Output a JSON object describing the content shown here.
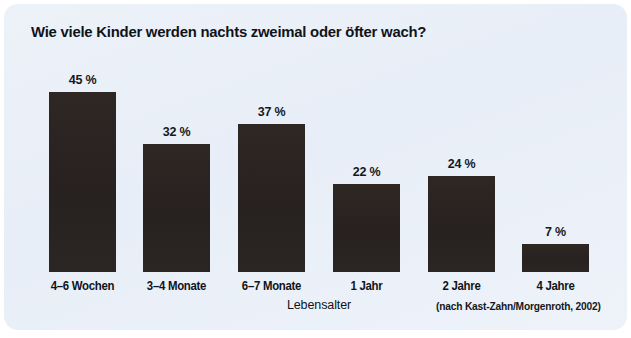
{
  "figure": {
    "title": "Wie viele Kinder werden nachts zweimal oder öfter wach?",
    "source_note": "(nach Kast-Zahn/Morgenroth, 2002)",
    "panel_color": "#eaf0f8",
    "bar_color": "#2a2422",
    "text_color": "#10141a"
  },
  "chart_data": {
    "type": "bar",
    "title": "Wie viele Kinder werden nachts zweimal oder öfter wach?",
    "xlabel": "Lebensalter",
    "ylabel": "",
    "categories": [
      "4–6 Wochen",
      "3–4 Monate",
      "6–7 Monate",
      "1 Jahr",
      "2 Jahre",
      "4 Jahre"
    ],
    "values": [
      45,
      32,
      37,
      22,
      24,
      7
    ],
    "value_labels": [
      "45 %",
      "32 %",
      "37 %",
      "22 %",
      "24 %",
      "7 %"
    ],
    "unit": "%",
    "ylim": [
      0,
      45
    ],
    "grid": false,
    "legend": null,
    "annotations": [
      "(nach Kast-Zahn/Morgenroth, 2002)"
    ],
    "bars": [
      {
        "category": "4–6 Wochen",
        "value": 45,
        "label": "45 %",
        "left": 45,
        "top": 88,
        "width": 67,
        "height": 180
      },
      {
        "category": "3–4 Monate",
        "value": 32,
        "label": "32 %",
        "left": 139,
        "top": 140,
        "width": 67,
        "height": 128
      },
      {
        "category": "6–7 Monate",
        "value": 37,
        "label": "37 %",
        "left": 234,
        "top": 120,
        "width": 67,
        "height": 148
      },
      {
        "category": "1 Jahr",
        "value": 22,
        "label": "22 %",
        "left": 329,
        "top": 180,
        "width": 67,
        "height": 88
      },
      {
        "category": "2 Jahre",
        "value": 24,
        "label": "24 %",
        "left": 424,
        "top": 172,
        "width": 67,
        "height": 96
      },
      {
        "category": "4 Jahre",
        "value": 7,
        "label": "7 %",
        "left": 518,
        "top": 240,
        "width": 67,
        "height": 28
      }
    ]
  }
}
